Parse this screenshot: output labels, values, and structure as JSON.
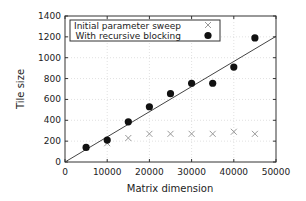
{
  "chart_data": {
    "type": "scatter",
    "title": "",
    "xlabel": "Matrix dimension",
    "ylabel": "Tile size",
    "xlim": [
      0,
      50000
    ],
    "ylim": [
      0,
      1400
    ],
    "xticks": [
      0,
      10000,
      20000,
      30000,
      40000,
      50000
    ],
    "yticks": [
      0,
      200,
      400,
      600,
      800,
      1000,
      1200,
      1400
    ],
    "grid": true,
    "legend_position": "upper left",
    "series": [
      {
        "name": "Initial parameter sweep",
        "marker": "x",
        "color": "#999999",
        "x": [
          10000,
          15000,
          20000,
          25000,
          30000,
          35000,
          40000,
          45000
        ],
        "y": [
          180,
          230,
          270,
          270,
          270,
          270,
          290,
          270
        ]
      },
      {
        "name": "With recursive blocking",
        "marker": "o",
        "color": "#111111",
        "x": [
          5000,
          10000,
          15000,
          20000,
          25000,
          30000,
          35000,
          40000,
          45000
        ],
        "y": [
          140,
          210,
          385,
          530,
          655,
          755,
          755,
          910,
          1190
        ]
      },
      {
        "name": "fit line",
        "marker": "line",
        "color": "#444444",
        "x": [
          0,
          50000
        ],
        "y": [
          0,
          1205
        ]
      }
    ]
  }
}
